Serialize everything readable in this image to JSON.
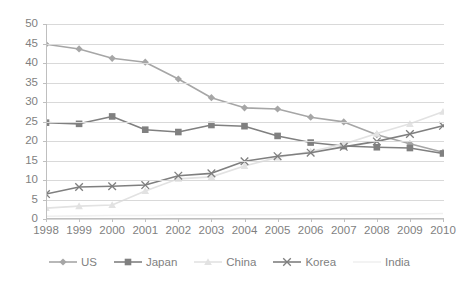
{
  "chart_data": {
    "type": "line",
    "title": "",
    "subtitle": "",
    "xlabel": "",
    "ylabel": "",
    "categories": [
      "1998",
      "1999",
      "2000",
      "2001",
      "2002",
      "2003",
      "2004",
      "2005",
      "2006",
      "2007",
      "2008",
      "2009",
      "2010"
    ],
    "x": [
      1998,
      1999,
      2000,
      2001,
      2002,
      2003,
      2004,
      2005,
      2006,
      2007,
      2008,
      2009,
      2010
    ],
    "ylim": [
      0,
      50
    ],
    "yticks": [
      0,
      5,
      10,
      15,
      20,
      25,
      30,
      35,
      40,
      45,
      50
    ],
    "grid": true,
    "legend_position": "bottom",
    "series": [
      {
        "name": "US",
        "color": "#a6a6a6",
        "marker": "diamond",
        "values": [
          44.8,
          43.6,
          41.2,
          40.2,
          35.9,
          31.1,
          28.5,
          28.2,
          26.1,
          24.9,
          21.6,
          19.3,
          17.1
        ]
      },
      {
        "name": "Japan",
        "color": "#808080",
        "marker": "square",
        "values": [
          24.7,
          24.4,
          26.3,
          22.9,
          22.3,
          24.1,
          23.8,
          21.3,
          19.6,
          18.7,
          18.4,
          18.2,
          16.8
        ]
      },
      {
        "name": "China",
        "color": "#e2e2e2",
        "marker": "triangle",
        "values": [
          2.8,
          3.3,
          3.6,
          7.2,
          10.3,
          10.8,
          13.6,
          15.8,
          17.3,
          19.2,
          21.9,
          24.4,
          27.5
        ]
      },
      {
        "name": "Korea",
        "color": "#7f7f7f",
        "marker": "x",
        "values": [
          6.4,
          8.2,
          8.4,
          8.7,
          11.1,
          11.7,
          14.8,
          16.1,
          17.0,
          18.5,
          19.9,
          21.8,
          23.9
        ]
      },
      {
        "name": "India",
        "color": "#f0f0f0",
        "marker": "none",
        "values": [
          0.7,
          0.8,
          0.9,
          0.9,
          1.0,
          1.0,
          1.1,
          1.1,
          1.2,
          1.2,
          1.3,
          1.3,
          1.4
        ]
      }
    ]
  },
  "legend": {
    "items": [
      {
        "label": "US"
      },
      {
        "label": "Japan"
      },
      {
        "label": "China"
      },
      {
        "label": "Korea"
      },
      {
        "label": "India"
      }
    ]
  }
}
